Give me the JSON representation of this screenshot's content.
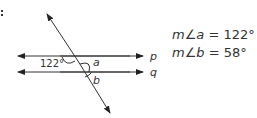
{
  "problem": {
    "number_marker": ".",
    "diagram": {
      "lines": [
        {
          "label": "p",
          "type": "parallel-line"
        },
        {
          "label": "q",
          "type": "parallel-line"
        },
        {
          "label": "",
          "type": "transversal"
        }
      ],
      "angle_labels": {
        "given": "122°",
        "a": "a",
        "b": "b"
      }
    },
    "answers": [
      {
        "var": "m∠a",
        "equals": "=",
        "value": "122°"
      },
      {
        "var": "m∠b",
        "equals": "=",
        "value": "58°"
      }
    ]
  }
}
